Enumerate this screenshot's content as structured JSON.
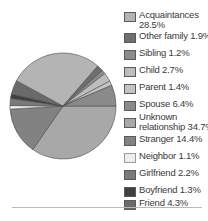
{
  "chart_data": {
    "type": "pie",
    "title": "",
    "start_angle_deg": 0,
    "direction": "clockwise",
    "legend_position": "right",
    "slices": [
      {
        "name": "Acquaintances",
        "value": 28.5,
        "color": "#b4b4b4"
      },
      {
        "name": "Other family",
        "value": 1.9,
        "color": "#6e6e6e"
      },
      {
        "name": "Sibling",
        "value": 1.2,
        "color": "#8c8c8c"
      },
      {
        "name": "Child",
        "value": 2.7,
        "color": "#bdbdbd"
      },
      {
        "name": "Parent",
        "value": 1.4,
        "color": "#c4c4c4"
      },
      {
        "name": "Spouse",
        "value": 6.4,
        "color": "#8a8a8a"
      },
      {
        "name": "Unknown relationship",
        "value": 34.7,
        "color": "#a8a8a8"
      },
      {
        "name": "Stranger",
        "value": 14.4,
        "color": "#828282"
      },
      {
        "name": "Neighbor",
        "value": 1.1,
        "color": "#ededed"
      },
      {
        "name": "Girlfriend",
        "value": 2.2,
        "color": "#7a7a7a"
      },
      {
        "name": "Boyfriend",
        "value": 1.3,
        "color": "#3f3f3f"
      },
      {
        "name": "Friend",
        "value": 4.3,
        "color": "#6a6a6a"
      }
    ],
    "draw_order": [
      "Unknown relationship",
      "Stranger",
      "Neighbor",
      "Girlfriend",
      "Boyfriend",
      "Friend",
      "Acquaintances",
      "Other family",
      "Sibling",
      "Child",
      "Parent",
      "Spouse"
    ]
  },
  "legend": [
    {
      "line1": "Acquaintances",
      "line2": "28.5%"
    },
    {
      "line1": "Other family 1.9%",
      "line2": ""
    },
    {
      "line1": "Sibling 1.2%",
      "line2": ""
    },
    {
      "line1": "Child 2.7%",
      "line2": ""
    },
    {
      "line1": "Parent 1.4%",
      "line2": ""
    },
    {
      "line1": "Spouse 6.4%",
      "line2": ""
    },
    {
      "line1": "Unknown",
      "line2": "relationship 34.7%"
    },
    {
      "line1": "Stranger 14.4%",
      "line2": ""
    },
    {
      "line1": "Neighbor 1.1%",
      "line2": ""
    },
    {
      "line1": "Girlfriend 2.2%",
      "line2": ""
    },
    {
      "line1": "Boyfriend 1.3%",
      "line2": ""
    },
    {
      "line1": "Friend 4.3%",
      "line2": ""
    }
  ]
}
